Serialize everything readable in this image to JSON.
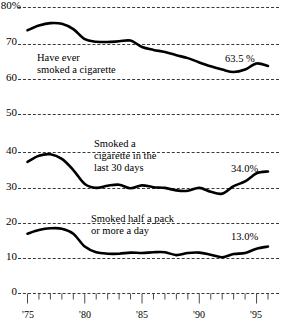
{
  "chart_data": {
    "type": "line",
    "title": "",
    "subtitle": "",
    "xlabel": "",
    "ylabel": "",
    "grid": true,
    "legend_position": "inline-annotations",
    "xlim": [
      1975,
      1996
    ],
    "ylim": [
      0,
      80
    ],
    "y_ticks": [
      {
        "value": 80,
        "label": "80%"
      },
      {
        "value": 70,
        "label": "70"
      },
      {
        "value": 60,
        "label": "60"
      },
      {
        "value": 50,
        "label": "50"
      },
      {
        "value": 40,
        "label": "40"
      },
      {
        "value": 30,
        "label": "30"
      },
      {
        "value": 20,
        "label": "20"
      },
      {
        "value": 10,
        "label": "10"
      },
      {
        "value": 0,
        "label": "0"
      }
    ],
    "x_ticks": [
      1975,
      1976,
      1977,
      1978,
      1979,
      1980,
      1981,
      1982,
      1983,
      1984,
      1985,
      1986,
      1987,
      1988,
      1989,
      1990,
      1991,
      1992,
      1993,
      1994,
      1995,
      1996
    ],
    "x_tick_labels": [
      {
        "value": 1975,
        "label": "'75"
      },
      {
        "value": 1980,
        "label": "'80"
      },
      {
        "value": 1985,
        "label": "'85"
      },
      {
        "value": 1990,
        "label": "'90"
      },
      {
        "value": 1995,
        "label": "'95"
      }
    ],
    "x": [
      1975,
      1976,
      1977,
      1978,
      1979,
      1980,
      1981,
      1982,
      1983,
      1984,
      1985,
      1986,
      1987,
      1988,
      1989,
      1990,
      1991,
      1992,
      1993,
      1994,
      1995,
      1996
    ],
    "series": [
      {
        "name": "Have ever smoked a cigarette",
        "annotation": [
          "Have ever",
          "smoked a cigarette"
        ],
        "end_label": "63.5 %",
        "end_value": 63.5,
        "values": [
          73.5,
          74.8,
          75.5,
          75.3,
          73.8,
          71.0,
          70.3,
          70.2,
          70.4,
          70.6,
          68.8,
          68.0,
          67.4,
          66.5,
          65.7,
          64.5,
          63.4,
          62.5,
          61.8,
          62.5,
          64.2,
          63.5
        ]
      },
      {
        "name": "Smoked a cigarette in the last 30 days",
        "annotation": [
          "Smoked a",
          "cigarette in the",
          "last 30 days"
        ],
        "end_label": "34.0%",
        "end_value": 34.0,
        "values": [
          36.7,
          38.4,
          38.8,
          37.5,
          34.4,
          30.5,
          29.4,
          30.0,
          30.3,
          29.3,
          30.1,
          29.6,
          29.4,
          28.7,
          28.6,
          29.4,
          28.3,
          27.8,
          29.9,
          31.2,
          33.5,
          34.0
        ]
      },
      {
        "name": "Smoked half a pack or more a day",
        "annotation": [
          "Smoked half a pack",
          "or more a day"
        ],
        "end_label": "13.0%",
        "end_value": 13.0,
        "values": [
          16.6,
          17.6,
          18.1,
          18.0,
          16.6,
          13.0,
          11.4,
          11.0,
          11.0,
          11.3,
          11.2,
          11.4,
          11.4,
          10.6,
          11.2,
          11.3,
          10.7,
          10.0,
          10.9,
          11.2,
          12.4,
          13.0
        ]
      }
    ]
  },
  "axis": {
    "y_unit_suffix": "%",
    "baseline_value": "0"
  },
  "colors": {
    "line": "#000000",
    "grid": "#3a3a3a",
    "background": "#ffffff",
    "text": "#000000"
  }
}
